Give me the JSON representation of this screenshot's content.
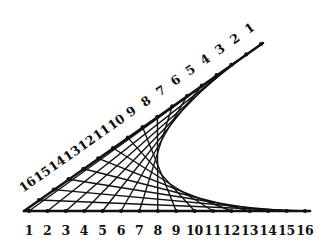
{
  "diagram": {
    "type": "string-art-envelope",
    "colors": {
      "line": "#111111",
      "background": "#ffffff"
    },
    "vertex": [
      24,
      211
    ],
    "bottom_axis": {
      "end": [
        310,
        211
      ],
      "labels": [
        "1",
        "2",
        "3",
        "4",
        "5",
        "6",
        "7",
        "8",
        "9",
        "10",
        "11",
        "12",
        "13",
        "14",
        "15",
        "16"
      ],
      "first_point": [
        29,
        211
      ],
      "step": [
        18.4,
        0
      ],
      "label_offset": [
        0,
        24
      ]
    },
    "diagonal_axis": {
      "end": [
        263,
        43
      ],
      "labels": [
        "1",
        "2",
        "3",
        "4",
        "5",
        "6",
        "7",
        "8",
        "9",
        "10",
        "11",
        "12",
        "13",
        "14",
        "15",
        "16"
      ],
      "first_point": [
        261,
        44
      ],
      "step": [
        -14.8,
        10.4
      ],
      "label_offset": [
        -11,
        -15
      ],
      "label_rotation": -35
    },
    "connections": "bottom point i joined to diagonal point i, for i = 1..16"
  }
}
